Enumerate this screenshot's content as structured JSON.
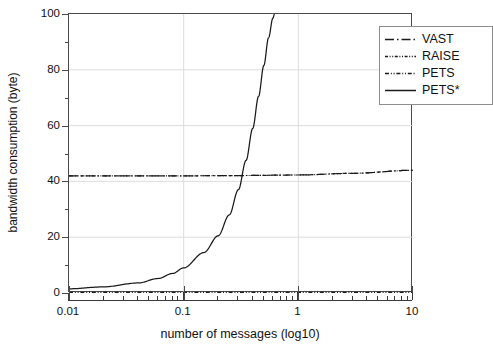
{
  "chart_data": {
    "type": "line",
    "title": "",
    "xlabel": "number of messages (log10)",
    "ylabel": "bandwidth consumption (byte)",
    "xscale": "log",
    "xlim": [
      0.01,
      10
    ],
    "ylim": [
      0,
      100
    ],
    "grid": true,
    "legend_position": "upper right",
    "x_major_ticks": [
      "0.01",
      "0.1",
      "1",
      "10"
    ],
    "x_major_values": [
      0.01,
      0.1,
      1,
      10
    ],
    "y_major_ticks": [
      "0",
      "20",
      "40",
      "60",
      "80",
      "100"
    ],
    "y_major_values": [
      0,
      20,
      40,
      60,
      80,
      100
    ],
    "y_minor_values": [
      10,
      30,
      50,
      70,
      90
    ],
    "series": [
      {
        "name": "VAST",
        "style": "dash-dot",
        "color": "#1a1a1a",
        "x": [
          0.01,
          0.1,
          0.3,
          1,
          3,
          10
        ],
        "values": [
          42.0,
          42.0,
          42.1,
          42.3,
          42.9,
          44.0
        ]
      },
      {
        "name": "RAISE",
        "style": "dash-dot-dot",
        "color": "#1a1a1a",
        "x": [
          0.01,
          0.1,
          0.3,
          1,
          3,
          10
        ],
        "values": [
          42.0,
          42.0,
          42.1,
          42.3,
          42.9,
          44.0
        ]
      },
      {
        "name": "PETS",
        "style": "dash-dot-dot",
        "color": "#1a1a1a",
        "x": [
          0.01,
          0.1,
          0.3,
          1,
          3,
          10
        ],
        "values": [
          0.2,
          0.2,
          0.2,
          0.2,
          0.2,
          0.2
        ]
      },
      {
        "name": "PETS*",
        "style": "solid",
        "color": "#1a1a1a",
        "x": [
          0.01,
          0.02,
          0.04,
          0.06,
          0.08,
          0.1,
          0.15,
          0.2,
          0.25,
          0.3,
          0.35,
          0.4,
          0.45,
          0.5,
          0.55,
          0.6,
          0.62
        ],
        "values": [
          1.5,
          2.2,
          3.6,
          5.2,
          7.0,
          9.0,
          14.5,
          20.5,
          28.0,
          37.0,
          47.5,
          59.0,
          70.5,
          81.5,
          91.5,
          98.5,
          100.0
        ]
      }
    ]
  },
  "legend": {
    "entries": [
      {
        "label": "VAST",
        "style": "dash-dot"
      },
      {
        "label": "RAISE",
        "style": "dash-dot-dot"
      },
      {
        "label": "PETS",
        "style": "dash-dot-dot"
      },
      {
        "label": "PETS*",
        "style": "solid"
      }
    ]
  }
}
